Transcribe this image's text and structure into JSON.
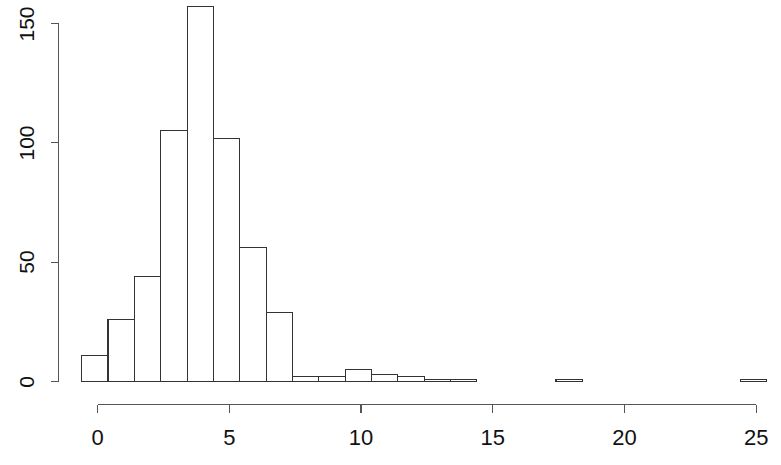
{
  "chart_data": {
    "type": "bar",
    "title": "",
    "subtitle": "",
    "xlabel": "",
    "ylabel": "",
    "grid": false,
    "legend": "none",
    "xlim": [
      -0.6,
      25.6
    ],
    "ylim": [
      0,
      150
    ],
    "x_ticks": [
      0,
      5,
      10,
      15,
      20,
      25
    ],
    "x_tick_labels": [
      "0",
      "5",
      "10",
      "15",
      "20",
      "25"
    ],
    "y_ticks": [
      0,
      50,
      100,
      150
    ],
    "y_tick_labels": [
      "0",
      "50",
      "100",
      "150"
    ],
    "bin_width": 1,
    "bin_edges": [
      -0.6,
      0.4,
      1.4,
      2.4,
      3.4,
      4.4,
      5.4,
      6.4,
      7.4,
      8.4,
      9.4,
      10.4,
      11.4,
      12.4,
      13.4,
      14.4,
      15.4,
      16.4,
      17.4,
      18.4,
      19.4,
      20.4,
      21.4,
      22.4,
      23.4,
      24.4,
      25.4
    ],
    "categories": [
      "-0.6–0.4",
      "0.4–1.4",
      "1.4–2.4",
      "2.4–3.4",
      "3.4–4.4",
      "4.4–5.4",
      "5.4–6.4",
      "6.4–7.4",
      "7.4–8.4",
      "8.4–9.4",
      "9.4–10.4",
      "10.4–11.4",
      "11.4–12.4",
      "12.4–13.4",
      "13.4–14.4",
      "14.4–15.4",
      "15.4–16.4",
      "16.4–17.4",
      "17.4–18.4",
      "18.4–19.4",
      "19.4–20.4",
      "20.4–21.4",
      "21.4–22.4",
      "22.4–23.4",
      "23.4–24.4",
      "24.4–25.4"
    ],
    "values": [
      11,
      26,
      44,
      105,
      157,
      102,
      56,
      29,
      2,
      2,
      5,
      3,
      2,
      1,
      1,
      0,
      0,
      0,
      1,
      0,
      0,
      0,
      0,
      0,
      0,
      1
    ],
    "bar_fill": "#ffffff",
    "bar_stroke": "#333333",
    "axis_color": "#555555",
    "background": "#ffffff"
  },
  "axes": {
    "y_axis_name": "y-axis",
    "x_axis_name": "x-axis"
  }
}
